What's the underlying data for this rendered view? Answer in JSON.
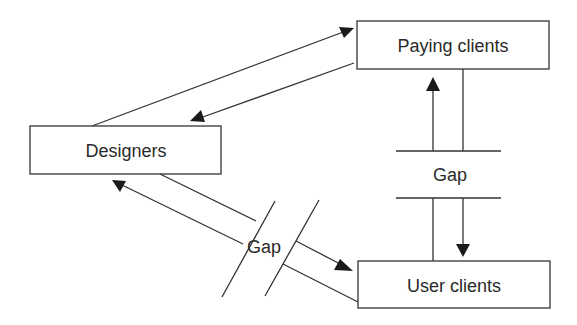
{
  "diagram": {
    "nodes": [
      {
        "id": "paying",
        "label": "Paying clients"
      },
      {
        "id": "designers",
        "label": "Designers"
      },
      {
        "id": "users",
        "label": "User clients"
      }
    ],
    "gaps": [
      {
        "id": "gap-vertical",
        "label": "Gap",
        "between": [
          "paying",
          "users"
        ]
      },
      {
        "id": "gap-diagonal",
        "label": "Gap",
        "between": [
          "designers",
          "users"
        ]
      }
    ],
    "edges": [
      {
        "from": "designers",
        "to": "paying",
        "arrow": "to"
      },
      {
        "from": "paying",
        "to": "designers",
        "arrow": "to"
      },
      {
        "from": "users",
        "to": "paying",
        "arrow": "to",
        "via_gap": "gap-vertical"
      },
      {
        "from": "paying",
        "to": "users",
        "arrow": "to",
        "via_gap": "gap-vertical"
      },
      {
        "from": "users",
        "to": "designers",
        "arrow": "to",
        "via_gap": "gap-diagonal"
      },
      {
        "from": "designers",
        "to": "users",
        "arrow": "to",
        "via_gap": "gap-diagonal"
      }
    ]
  }
}
